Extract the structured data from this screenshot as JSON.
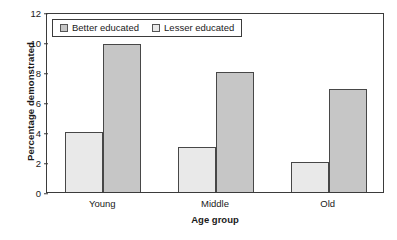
{
  "chart_data": {
    "type": "bar",
    "title": "",
    "xlabel": "Age group",
    "ylabel": "Percentage demonstrated",
    "categories": [
      "Young",
      "Middle",
      "Old"
    ],
    "series": [
      {
        "name": "Lesser educated",
        "values": [
          4,
          3,
          2
        ],
        "color": "#e9e9e9"
      },
      {
        "name": "Better educated",
        "values": [
          9.9,
          8,
          6.9
        ],
        "color": "#c6c6c6"
      }
    ],
    "ylim": [
      0,
      12
    ],
    "yticks": [
      0,
      2,
      4,
      6,
      8,
      10,
      12
    ],
    "grid": false,
    "legend": {
      "position": "top-left-inside",
      "entries": [
        {
          "label": "Better educated",
          "color": "#c6c6c6"
        },
        {
          "label": "Lesser educated",
          "color": "#e9e9e9"
        }
      ]
    },
    "bar_order_in_group": [
      "Lesser educated",
      "Better educated"
    ],
    "axis_color": "#3b3b3b",
    "bar_edge_color": "#474747",
    "background": "#ffffff"
  }
}
